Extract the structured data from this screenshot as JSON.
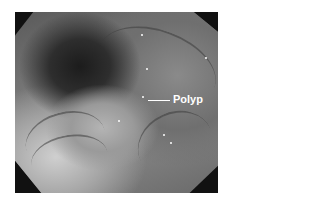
{
  "image": {
    "description": "Grayscale endoscopic (colonoscopy) image showing a polyp on the colon wall",
    "annotation": {
      "label": "Polyp",
      "color": "#ffffff"
    }
  }
}
